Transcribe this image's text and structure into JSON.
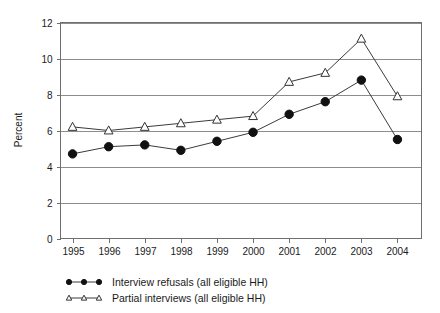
{
  "chart_data": {
    "type": "line",
    "title": "",
    "xlabel": "",
    "ylabel": "Percent",
    "categories": [
      "1995",
      "1996",
      "1997",
      "1998",
      "1999",
      "2000",
      "2001",
      "2002",
      "2003",
      "2004"
    ],
    "ylim": [
      0,
      12
    ],
    "yticks": [
      0,
      2,
      4,
      6,
      8,
      10,
      12
    ],
    "ytick_labels": [
      "0",
      "2",
      "4",
      "6",
      "8",
      "10",
      "12"
    ],
    "grid": true,
    "legend_position": "bottom-left",
    "series": [
      {
        "name": "Interview refusals (all eligible HH)",
        "marker": "filled-circle",
        "values": [
          4.7,
          5.1,
          5.2,
          4.9,
          5.4,
          5.9,
          6.9,
          7.6,
          8.8,
          5.5
        ]
      },
      {
        "name": "Partial interviews (all eligible HH)",
        "marker": "open-triangle",
        "values": [
          6.2,
          6.0,
          6.2,
          6.4,
          6.6,
          6.8,
          8.7,
          9.2,
          11.1,
          7.9
        ]
      }
    ]
  },
  "legend": {
    "items": [
      {
        "label": "Interview refusals (all eligible HH)",
        "marker": "filled-circle"
      },
      {
        "label": "Partial interviews (all eligible HH)",
        "marker": "open-triangle"
      }
    ]
  },
  "colors": {
    "line": "#3b3b3b",
    "marker_fill": "#111111",
    "marker_open": "#ffffff",
    "grid": "#8d8d8d",
    "frame": "#6f6f6f",
    "text": "#1a1a1a",
    "background": "#ffffff"
  }
}
